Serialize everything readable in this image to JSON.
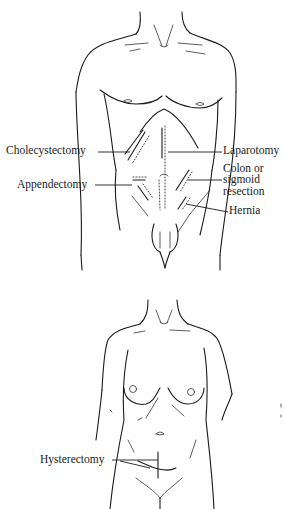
{
  "figure": {
    "top_figure": {
      "subject": "male torso",
      "labels": {
        "cholecystectomy": "Cholecystectomy",
        "appendectomy": "Appendectomy",
        "laparotomy": "Laparotomy",
        "colon_line1": "Colon or",
        "colon_line2": "sigmoid",
        "colon_line3": "resection",
        "hernia": "Hernia"
      }
    },
    "bottom_figure": {
      "subject": "female torso",
      "labels": {
        "hysterectomy": "Hysterectomy"
      }
    },
    "colors": {
      "line": "#1a1a1a",
      "background": "#ffffff"
    }
  }
}
